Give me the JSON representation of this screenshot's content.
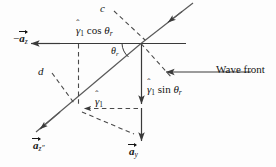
{
  "figure": {
    "background_color": "#fdfdfd",
    "stroke_color": "#3a3a3a",
    "text_color": "#151515"
  },
  "labels": {
    "ray_upper_c": "c",
    "ray_lower_d": "d",
    "gamma_cos": {
      "gamma": "γ",
      "hat": "ˆ",
      "sub": "1",
      "func": "cos",
      "theta": "θ",
      "theta_sub": "r"
    },
    "gamma_sin": {
      "gamma": "γ",
      "hat": "ˆ",
      "sub": "1",
      "func": "sin",
      "theta": "θ",
      "theta_sub": "r"
    },
    "gamma_1": {
      "gamma": "γ",
      "hat": "ˆ",
      "sub": "1"
    },
    "angle_theta_r": {
      "theta": "θ",
      "sub": "r"
    },
    "wave_front": "Wave front",
    "unit_vector_minus_az": {
      "minus": "−",
      "a": "a",
      "sub": "z"
    },
    "unit_vector_az_double_prime": {
      "a": "a",
      "sub": "z",
      "prime": "″"
    },
    "unit_vector_ay": {
      "a": "a",
      "sub": "y"
    }
  },
  "geometry": {
    "origin_node": [
      141,
      43
    ],
    "lower_node": [
      78,
      108
    ],
    "incident_ray_start": [
      193,
      3
    ],
    "reflected_ray_end": [
      37,
      131
    ],
    "horizontal_line": [
      14,
      43,
      186,
      43
    ],
    "vertical_drop": [
      141,
      43,
      141,
      143
    ],
    "wave_front_arrow": [
      251,
      72,
      166,
      72
    ],
    "dashed_rect": [
      78,
      43,
      141,
      108
    ]
  }
}
